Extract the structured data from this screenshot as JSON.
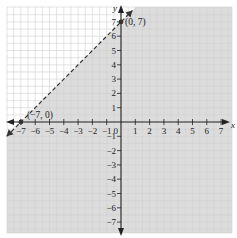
{
  "chart_data": {
    "type": "line",
    "title": "",
    "xlabel": "x",
    "ylabel": "y",
    "xlim": [
      -7,
      7
    ],
    "ylim": [
      -7,
      7
    ],
    "grid": true,
    "x_ticks": [
      -7,
      -6,
      -5,
      -4,
      -3,
      -2,
      -1,
      1,
      2,
      3,
      4,
      5,
      6,
      7
    ],
    "y_ticks": [
      7,
      6,
      5,
      4,
      3,
      2,
      1,
      -1,
      -2,
      -3,
      -4,
      -5,
      -6,
      -7
    ],
    "x_tick_labels": [
      "−7",
      "−6",
      "−5",
      "−4",
      "−3",
      "−2",
      "−1",
      "1",
      "2",
      "3",
      "4",
      "5",
      "6",
      "7"
    ],
    "y_tick_labels": [
      "7",
      "6",
      "5",
      "4",
      "3",
      "2",
      "1",
      "−1",
      "−2",
      "−3",
      "−4",
      "−5",
      "−6",
      "−7"
    ],
    "origin_label": "0",
    "boundary": {
      "style": "dashed",
      "slope": 1,
      "intercept": 7,
      "equation": "y = x + 7"
    },
    "shaded_region": "below-right of boundary",
    "points": [
      {
        "x": -7,
        "y": 0,
        "label": "(−7, 0)"
      },
      {
        "x": 0,
        "y": 7,
        "label": "(0, 7)"
      }
    ],
    "colors": {
      "shade": "#dcdcdc",
      "grid": "#d0d0d0",
      "axis": "#222222",
      "line": "#333333"
    }
  }
}
